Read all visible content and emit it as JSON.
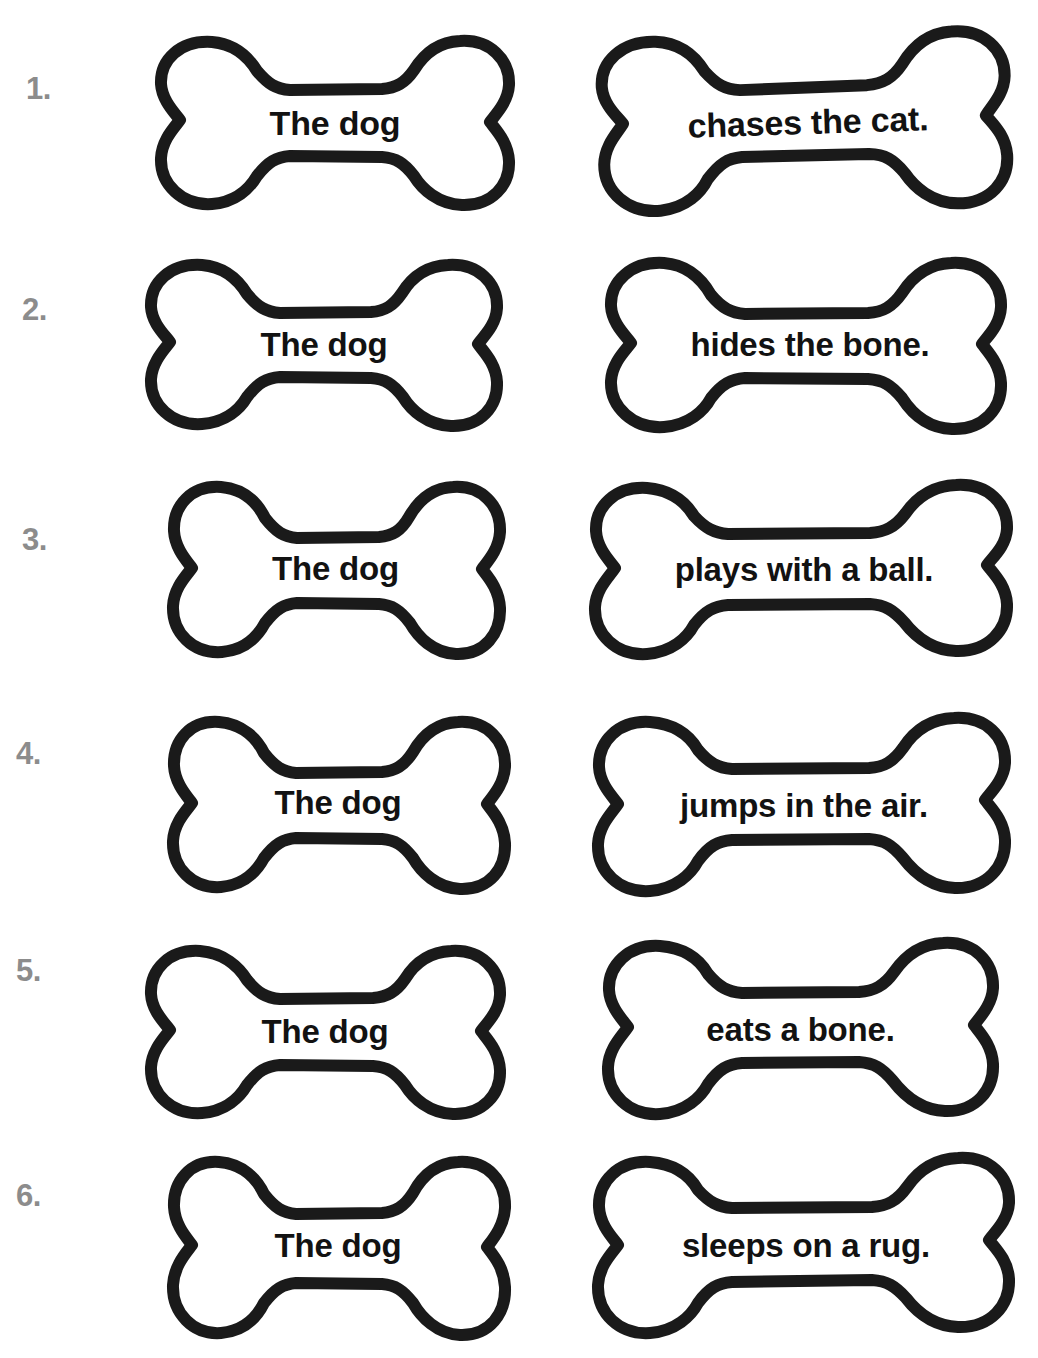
{
  "page": {
    "background_color": "#ffffff",
    "number_color": "#8c8c8c",
    "outline_color": "#1a1a1a",
    "bone_fill_color": "#ffffff",
    "text_color": "#121212"
  },
  "rows": [
    {
      "number": "1.",
      "subject": "The dog",
      "predicate": "chases the cat."
    },
    {
      "number": "2.",
      "subject": "The dog",
      "predicate": "hides the bone."
    },
    {
      "number": "3.",
      "subject": "The dog",
      "predicate": "plays with a ball."
    },
    {
      "number": "4.",
      "subject": "The dog",
      "predicate": "jumps in the air."
    },
    {
      "number": "5.",
      "subject": "The dog",
      "predicate": "eats a bone."
    },
    {
      "number": "6.",
      "subject": "The dog",
      "predicate": "sleeps on a rug."
    }
  ]
}
